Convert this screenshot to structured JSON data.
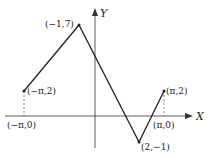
{
  "diagram": {
    "axes": {
      "x_label": "X",
      "y_label": "Y"
    },
    "points": [
      {
        "label": "(−π,2)",
        "x": "-pi",
        "y": 2
      },
      {
        "label": "(−1,7)",
        "x": -1,
        "y": 7
      },
      {
        "label": "(2,−1)",
        "x": 2,
        "y": -1
      },
      {
        "label": "(π,2)",
        "x": "pi",
        "y": 2
      }
    ],
    "axis_points": [
      {
        "label": "(−π,0)"
      },
      {
        "label": "(π,0)"
      }
    ],
    "colors": {
      "line": "#222222",
      "background": "#ffffff"
    }
  }
}
